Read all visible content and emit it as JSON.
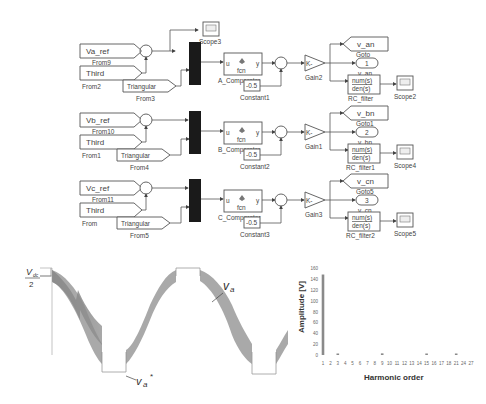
{
  "diagram": {
    "rows": [
      {
        "phase": "a",
        "ref_label": "Va_ref",
        "ref_from": "From9",
        "third_label": "Third",
        "third_from": "From2",
        "tri_label": "Triangular",
        "tri_from": "From3",
        "scope_top": "Scope3",
        "comparator_fcn": "fcn",
        "comparator_in": "u",
        "comparator_out": "y",
        "comparator_name": "A_Comparator",
        "constant_value": "-0.5",
        "constant_name": "Constant1",
        "gain_symbol": "K-",
        "gain_name": "Gain2",
        "goto_out_label": "v_an",
        "goto_tag": "1",
        "goto_name": "Goto",
        "goto_sublabel": "v_an",
        "filter_num": "num(s)",
        "filter_den": "den(s)",
        "filter_name": "RC_filter",
        "scope_name": "Scope2"
      },
      {
        "phase": "b",
        "ref_label": "Vb_ref",
        "ref_from": "From10",
        "third_label": "Third",
        "third_from": "From1",
        "tri_label": "Triangular",
        "tri_from": "From4",
        "comparator_fcn": "fcn",
        "comparator_in": "u",
        "comparator_out": "y",
        "comparator_name": "B_Comparator",
        "constant_value": "-0.5",
        "constant_name": "Constant2",
        "gain_symbol": "K-",
        "gain_name": "Gain1",
        "goto_out_label": "v_bn",
        "goto_tag": "2",
        "goto_name": "Goto1",
        "goto_sublabel": "v_bn",
        "filter_num": "num(s)",
        "filter_den": "den(s)",
        "filter_name": "RC_filter1",
        "scope_name": "Scope4"
      },
      {
        "phase": "c",
        "ref_label": "Vc_ref",
        "ref_from": "From11",
        "third_label": "Third",
        "third_from": "From",
        "tri_label": "Triangular",
        "tri_from": "From5",
        "comparator_fcn": "fcn",
        "comparator_in": "u",
        "comparator_out": "y",
        "comparator_name": "C_Comparator",
        "constant_value": "-0.5",
        "constant_name": "Constant3",
        "gain_symbol": "K-",
        "gain_name": "Gain3",
        "goto_out_label": "v_cn",
        "goto_tag": "3",
        "goto_name": "Goto5",
        "goto_sublabel": "v_cn",
        "filter_num": "num(s)",
        "filter_den": "den(s)",
        "filter_name": "RC_filter2",
        "scope_name": "Scope5"
      }
    ]
  },
  "waveform": {
    "y_label_num": "V",
    "y_label_sub": "dc",
    "y_label_den": "2",
    "annot_va": "v",
    "annot_va_sub": "a",
    "annot_va_star": "v",
    "annot_va_star_sub": "a",
    "annot_star": "*"
  },
  "chart_data": {
    "type": "bar",
    "title": "",
    "xlabel": "Harmonic order",
    "ylabel": "Amplitude [V]",
    "ylim": [
      0,
      160
    ],
    "yticks": [
      0,
      20,
      40,
      60,
      80,
      100,
      120,
      140,
      160
    ],
    "categories": [
      "1",
      "2",
      "3",
      "4",
      "5",
      "6",
      "7",
      "8",
      "9",
      "10",
      "11",
      "12",
      "13",
      "14",
      "15",
      "16",
      "17",
      "18",
      "21",
      "24",
      "27"
    ],
    "values": [
      148,
      0,
      2,
      0,
      0,
      0,
      0,
      0,
      3,
      0,
      0,
      0,
      0,
      0,
      2,
      0,
      0,
      0,
      1,
      0,
      0
    ],
    "bar_color": "#8a8a8a",
    "grid": false
  }
}
